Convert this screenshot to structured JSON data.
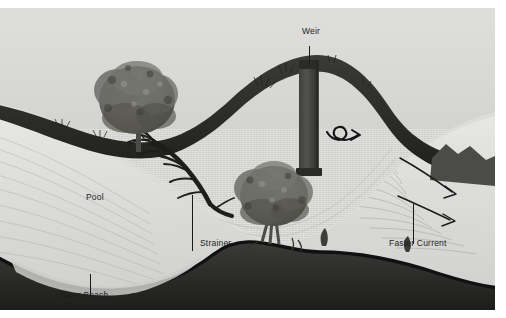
{
  "illustration": {
    "title": "River Cross-Section Hazards Diagram",
    "medium": "grayscale pencil illustration",
    "background_color": "#d6d6d4",
    "ink_color": "#1a1a1a"
  },
  "labels": [
    {
      "id": "pool",
      "text": "Pool",
      "x": 86,
      "y": 193
    },
    {
      "id": "strainer",
      "text": "Strainer",
      "x": 200,
      "y": 239
    },
    {
      "id": "weir",
      "text": "Weir",
      "x": 302,
      "y": 27
    },
    {
      "id": "faster_current",
      "text": "Faster Current",
      "x": 389,
      "y": 239
    },
    {
      "id": "river_beach",
      "text": "River Beach",
      "x": 60,
      "y": 291
    }
  ],
  "features": {
    "pool": "slow deep water on the inside bend at left",
    "strainer": "fallen bare tree with branches reaching into the current",
    "weir": "dark vertical man-made barrier spanning the channel",
    "faster_current": "accelerated flow along the outer bend at right",
    "river_beach": "gravel bar deposited on the inside of the bend",
    "eddy": "curled recirculating arrow downstream of the weir",
    "flow_arrows": "two long curved arrows pointing downstream",
    "trees": "two leafy round-canopy trees on the banks"
  }
}
